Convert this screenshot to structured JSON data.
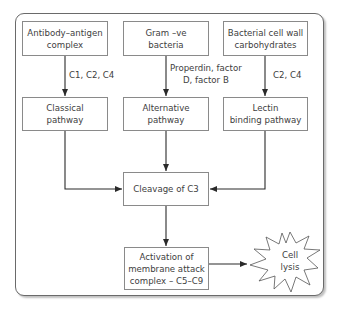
{
  "diagram": {
    "title": "",
    "nodes": {
      "antibody_antigen": "Antibody–antigen complex",
      "gram_neg": "Gram –ve bacteria",
      "bacterial_wall": "Bacterial cell wall carbohydrates",
      "classical": "Classical pathway",
      "alternative": "Alternative pathway",
      "lectin": "Lectin binding pathway",
      "cleavage_c3": "Cleavage of C3",
      "mac": "Activation of membrane attack complex – C5–C9",
      "cell_lysis": "Cell lysis"
    },
    "edge_labels": {
      "classical": "C1, C2, C4",
      "alternative_line1": "Properdin, factor",
      "alternative_line2": "D, factor B",
      "lectin": "C2, C4"
    },
    "node_lines": {
      "antibody_antigen": [
        "Antibody–antigen",
        "complex"
      ],
      "gram_neg": [
        "Gram –ve",
        "bacteria"
      ],
      "bacterial_wall": [
        "Bacterial cell wall",
        "carbohydrates"
      ],
      "classical": [
        "Classical",
        "pathway"
      ],
      "alternative": [
        "Alternative",
        "pathway"
      ],
      "lectin": [
        "Lectin",
        "binding pathway"
      ],
      "cleavage_c3": [
        "Cleavage of C3"
      ],
      "mac": [
        "Activation of",
        "membrane attack",
        "complex – C5–C9"
      ],
      "cell_lysis": [
        "Cell",
        "lysis"
      ]
    },
    "edges": [
      {
        "from": "antibody_antigen",
        "to": "classical",
        "label": "C1, C2, C4"
      },
      {
        "from": "gram_neg",
        "to": "alternative",
        "label": "Properdin, factor D, factor B"
      },
      {
        "from": "bacterial_wall",
        "to": "lectin",
        "label": "C2, C4"
      },
      {
        "from": "classical",
        "to": "cleavage_c3"
      },
      {
        "from": "alternative",
        "to": "cleavage_c3"
      },
      {
        "from": "lectin",
        "to": "cleavage_c3"
      },
      {
        "from": "cleavage_c3",
        "to": "mac"
      },
      {
        "from": "mac",
        "to": "cell_lysis"
      }
    ]
  }
}
